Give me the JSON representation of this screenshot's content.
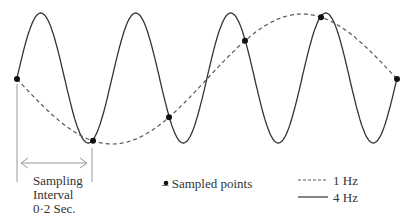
{
  "diagram": {
    "title": "",
    "signals": [
      {
        "name": "4 Hz",
        "frequency_hz": 4,
        "style": "solid",
        "color": "#333333"
      },
      {
        "name": "1 Hz",
        "frequency_hz": 1,
        "style": "dashed",
        "color": "#555555"
      }
    ],
    "sampling_interval_label": [
      "Sampling",
      "Interval",
      "0·2 Sec."
    ],
    "sampled_points_label": "– Sampled points",
    "legend": [
      {
        "label": "1 Hz",
        "style": "dashed"
      },
      {
        "label": "4 Hz",
        "style": "solid"
      }
    ],
    "sample_count": 6,
    "cycles_4hz_shown": 4,
    "colors": {
      "line": "#333333",
      "point": "#111111",
      "guide": "#999999"
    }
  }
}
